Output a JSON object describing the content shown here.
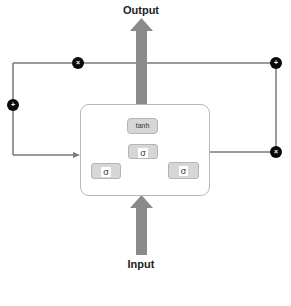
{
  "diagram": {
    "title": "",
    "labels": {
      "output": "Output",
      "input": "Input"
    },
    "nodes": [
      {
        "id": "top-multiply",
        "symbol": "×"
      },
      {
        "id": "top-add",
        "symbol": "+"
      },
      {
        "id": "left-add",
        "symbol": "+"
      },
      {
        "id": "right-multiply",
        "symbol": "×"
      }
    ],
    "cell": {
      "gates": [
        {
          "id": "tanh-gate",
          "label": "tanh"
        },
        {
          "id": "sigma-center",
          "label": "σ"
        },
        {
          "id": "sigma-left",
          "label": "σ"
        },
        {
          "id": "sigma-right",
          "label": "σ"
        }
      ]
    },
    "colors": {
      "arrow": "#8a8a8a",
      "line": "#7a7a7a",
      "node": "#0a0a0a",
      "gate_fill": "#d6d6d6",
      "cell_border": "#b8b8b8"
    }
  }
}
